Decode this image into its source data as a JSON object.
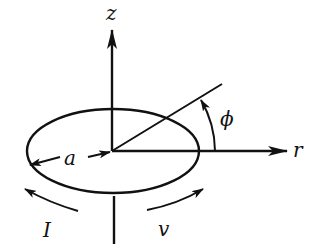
{
  "diagram": {
    "labels": {
      "z_axis": "z",
      "r_axis": "r",
      "angle": "ϕ",
      "radius": "a",
      "current": "I",
      "velocity": "v"
    },
    "colors": {
      "stroke": "#111111",
      "background": "#ffffff"
    }
  }
}
